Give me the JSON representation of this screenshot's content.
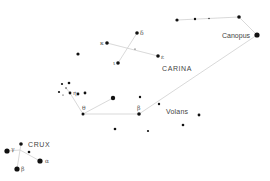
{
  "colors": {
    "background": "#ffffff",
    "star": "#111111",
    "line": "#cfcfcf",
    "label": "#444444"
  },
  "constellations": [
    {
      "name": "CARINA",
      "label_pos": [
        162,
        65
      ]
    },
    {
      "name": "Volans",
      "label_pos": [
        166,
        108
      ]
    },
    {
      "name": "CRUX",
      "label_pos": [
        28,
        141
      ]
    }
  ],
  "named_stars": [
    {
      "name": "Canopus",
      "label_pos": [
        222,
        32
      ]
    }
  ],
  "greek_labels": [
    {
      "letter": "δ",
      "pos": [
        140,
        30
      ]
    },
    {
      "letter": "κ",
      "pos": [
        100,
        40
      ]
    },
    {
      "letter": "ε",
      "pos": [
        161,
        54
      ]
    },
    {
      "letter": "ι",
      "pos": [
        113,
        60
      ]
    },
    {
      "letter": "η",
      "pos": [
        69,
        88
      ]
    },
    {
      "letter": "θ",
      "pos": [
        82,
        105
      ]
    },
    {
      "letter": "β",
      "pos": [
        137,
        105
      ]
    },
    {
      "letter": "γ",
      "pos": [
        11,
        146
      ]
    },
    {
      "letter": "α",
      "pos": [
        46,
        158
      ]
    },
    {
      "letter": "β",
      "pos": [
        21,
        166
      ]
    }
  ],
  "stars": [
    {
      "x": 177,
      "y": 20,
      "r": 1.6
    },
    {
      "x": 195,
      "y": 19,
      "r": 1.2
    },
    {
      "x": 209,
      "y": 18.5,
      "r": 0.7
    },
    {
      "x": 239,
      "y": 17,
      "r": 1.8
    },
    {
      "x": 257,
      "y": 35,
      "r": 2.6
    },
    {
      "x": 137,
      "y": 33,
      "r": 1.8
    },
    {
      "x": 107,
      "y": 43,
      "r": 1.8
    },
    {
      "x": 158,
      "y": 56,
      "r": 1.8
    },
    {
      "x": 118,
      "y": 63,
      "r": 1.8
    },
    {
      "x": 78,
      "y": 54,
      "r": 1.6
    },
    {
      "x": 135,
      "y": 49,
      "r": 0.6
    },
    {
      "x": 62,
      "y": 84,
      "r": 1.1
    },
    {
      "x": 69,
      "y": 83,
      "r": 1.3
    },
    {
      "x": 66,
      "y": 88,
      "r": 0.7
    },
    {
      "x": 59,
      "y": 92,
      "r": 1.1
    },
    {
      "x": 70,
      "y": 93,
      "r": 1.4
    },
    {
      "x": 78,
      "y": 94,
      "r": 1.4
    },
    {
      "x": 85,
      "y": 93,
      "r": 1.4
    },
    {
      "x": 63,
      "y": 95,
      "r": 0.6
    },
    {
      "x": 113,
      "y": 98,
      "r": 2.2
    },
    {
      "x": 83,
      "y": 114,
      "r": 1.5
    },
    {
      "x": 139,
      "y": 114,
      "r": 1.8
    },
    {
      "x": 140,
      "y": 97,
      "r": 1.2
    },
    {
      "x": 159,
      "y": 104,
      "r": 1.2
    },
    {
      "x": 199,
      "y": 115,
      "r": 1.4
    },
    {
      "x": 183,
      "y": 125,
      "r": 1.3
    },
    {
      "x": 115,
      "y": 129,
      "r": 1.3
    },
    {
      "x": 148,
      "y": 131,
      "r": 1.1
    },
    {
      "x": 21,
      "y": 144,
      "r": 1.8
    },
    {
      "x": 7,
      "y": 151,
      "r": 2.6
    },
    {
      "x": 29,
      "y": 152,
      "r": 1.3
    },
    {
      "x": 40,
      "y": 161,
      "r": 2.6
    },
    {
      "x": 17,
      "y": 169,
      "r": 2.6
    }
  ],
  "lines": [
    [
      177,
      20,
      239,
      17
    ],
    [
      239,
      17,
      257,
      35
    ],
    [
      257,
      35,
      139,
      114
    ],
    [
      107,
      43,
      158,
      56
    ],
    [
      137,
      33,
      118,
      63
    ],
    [
      139,
      114,
      83,
      114
    ],
    [
      83,
      114,
      113,
      98
    ],
    [
      83,
      114,
      70,
      93
    ],
    [
      70,
      93,
      66,
      88
    ],
    [
      20,
      150,
      40,
      161
    ],
    [
      20,
      150,
      17,
      169
    ],
    [
      21,
      144,
      20,
      150
    ],
    [
      7,
      151,
      20,
      150
    ]
  ]
}
